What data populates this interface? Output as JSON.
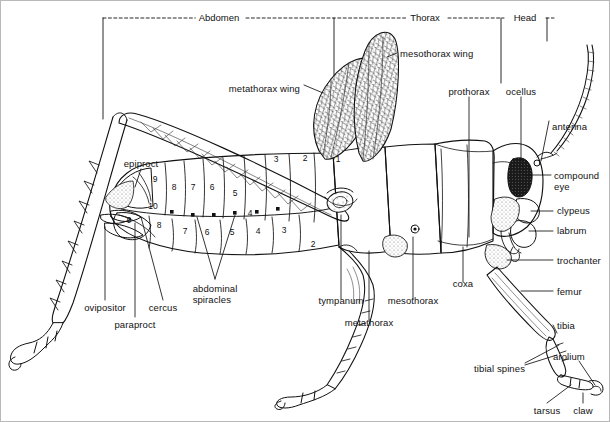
{
  "figure": {
    "view": "lateral",
    "style": "line-drawing",
    "background_color": "#ffffff",
    "line_color": "#111111",
    "border_color": "#b9b9b9"
  },
  "body_regions": [
    {
      "name": "Abdomen",
      "label": "Abdomen",
      "bracket_x1": 102,
      "bracket_x2": 333,
      "label_x": 218,
      "y": 17
    },
    {
      "name": "Thorax",
      "label": "Thorax",
      "bracket_x1": 333,
      "bracket_x2": 500,
      "label_x": 424,
      "y": 17
    },
    {
      "name": "Head",
      "label": "Head",
      "bracket_x1": 500,
      "bracket_x2": 546,
      "label_x": 524,
      "y": 17
    }
  ],
  "abdominal_segments": {
    "upper_row": [
      {
        "number": "9",
        "x": 154,
        "y": 178
      },
      {
        "number": "8",
        "x": 173,
        "y": 186
      },
      {
        "number": "7",
        "x": 192,
        "y": 186
      },
      {
        "number": "6",
        "x": 211,
        "y": 186
      },
      {
        "number": "5",
        "x": 234,
        "y": 192
      },
      {
        "number": "3",
        "x": 275,
        "y": 158
      },
      {
        "number": "2",
        "x": 304,
        "y": 157
      },
      {
        "number": "1",
        "x": 337,
        "y": 158
      }
    ],
    "lower_row": [
      {
        "number": "10",
        "x": 152,
        "y": 205
      },
      {
        "number": "9",
        "x": 128,
        "y": 219
      },
      {
        "number": "8",
        "x": 158,
        "y": 224
      },
      {
        "number": "7",
        "x": 184,
        "y": 230
      },
      {
        "number": "6",
        "x": 206,
        "y": 231
      },
      {
        "number": "5",
        "x": 231,
        "y": 231
      },
      {
        "number": "4",
        "x": 257,
        "y": 230
      },
      {
        "number": "3",
        "x": 283,
        "y": 229
      },
      {
        "number": "2",
        "x": 312,
        "y": 243
      },
      {
        "number": "4",
        "x": 249,
        "y": 212
      }
    ],
    "spiracle_dots": [
      {
        "x": 171,
        "y": 211
      },
      {
        "x": 192,
        "y": 214
      },
      {
        "x": 213,
        "y": 214
      },
      {
        "x": 234,
        "y": 212
      },
      {
        "x": 256,
        "y": 211
      },
      {
        "x": 277,
        "y": 208
      }
    ]
  },
  "labels": [
    {
      "id": "metathorax-wing",
      "text": "metathorax wing",
      "x": 299,
      "y": 82,
      "align": "right"
    },
    {
      "id": "mesothorax-wing",
      "text": "mesothorax wing",
      "x": 399,
      "y": 47,
      "align": "left"
    },
    {
      "id": "prothorax",
      "text": "prothorax",
      "x": 448,
      "y": 90,
      "align": "left"
    },
    {
      "id": "ocellus",
      "text": "ocellus",
      "x": 509,
      "y": 90,
      "align": "left"
    },
    {
      "id": "antenna",
      "text": "antenna",
      "x": 551,
      "y": 125,
      "align": "left"
    },
    {
      "id": "compound-eye",
      "text": "compound\neye",
      "x": 553,
      "y": 174,
      "align": "left"
    },
    {
      "id": "clypeus",
      "text": "clypeus",
      "x": 556,
      "y": 209,
      "align": "left"
    },
    {
      "id": "labrum",
      "text": "labrum",
      "x": 556,
      "y": 229,
      "align": "left"
    },
    {
      "id": "trochanter",
      "text": "trochanter",
      "x": 556,
      "y": 259,
      "align": "left"
    },
    {
      "id": "femur",
      "text": "femur",
      "x": 556,
      "y": 290,
      "align": "left"
    },
    {
      "id": "tibia",
      "text": "tibia",
      "x": 556,
      "y": 324,
      "align": "left"
    },
    {
      "id": "arolium",
      "text": "arolium",
      "x": 566,
      "y": 355,
      "align": "left"
    },
    {
      "id": "tibial-spines",
      "text": "tibial spines",
      "x": 482,
      "y": 367,
      "align": "left"
    },
    {
      "id": "tarsus",
      "text": "tarsus",
      "x": 530,
      "y": 408,
      "align": "left"
    },
    {
      "id": "claw",
      "text": "claw",
      "x": 572,
      "y": 408,
      "align": "left"
    },
    {
      "id": "coxa",
      "text": "coxa",
      "x": 450,
      "y": 288,
      "align": "left"
    },
    {
      "id": "mesothorax",
      "text": "mesothorax",
      "x": 397,
      "y": 305,
      "align": "left"
    },
    {
      "id": "metathorax",
      "text": "metathorax",
      "x": 346,
      "y": 327,
      "align": "left"
    },
    {
      "id": "tympanum",
      "text": "tympanum",
      "x": 317,
      "y": 305,
      "align": "left"
    },
    {
      "id": "abdominal-spiracles",
      "text": "abdominal\nspiracles",
      "x": 195,
      "y": 287,
      "align": "left"
    },
    {
      "id": "cercus",
      "text": "cercus",
      "x": 145,
      "y": 306,
      "align": "left"
    },
    {
      "id": "paraproct",
      "text": "paraproct",
      "x": 117,
      "y": 322,
      "align": "left"
    },
    {
      "id": "ovipositor",
      "text": "ovipositor",
      "x": 88,
      "y": 306,
      "align": "left"
    },
    {
      "id": "epiproct",
      "text": "epiproct",
      "x": 120,
      "y": 162,
      "align": "left"
    }
  ]
}
